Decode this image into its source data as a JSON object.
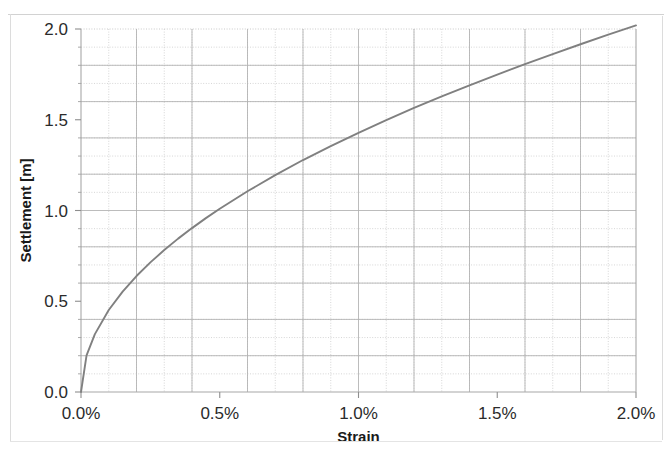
{
  "chart_data": {
    "type": "line",
    "title": "",
    "xlabel": "Strain",
    "ylabel": "Settlement [m]",
    "xlim": [
      0.0,
      2.0
    ],
    "ylim": [
      0.0,
      2.0
    ],
    "x_tick_labels": [
      "0.0%",
      "0.5%",
      "1.0%",
      "1.5%",
      "2.0%"
    ],
    "x_tick_values": [
      0.0,
      0.5,
      1.0,
      1.5,
      2.0
    ],
    "y_tick_labels": [
      "0.0",
      "0.5",
      "1.0",
      "1.5",
      "2.0"
    ],
    "y_tick_values": [
      0.0,
      0.5,
      1.0,
      1.5,
      2.0
    ],
    "grid": "major-solid-and-minor-dotted",
    "x_minor_step": 0.1,
    "y_minor_step": 0.1,
    "legend": "none",
    "series": [
      {
        "name": "Settlement vs Strain",
        "color": "#808080",
        "x": [
          0.0,
          0.02,
          0.05,
          0.1,
          0.15,
          0.2,
          0.25,
          0.3,
          0.35,
          0.4,
          0.45,
          0.5,
          0.6,
          0.7,
          0.8,
          0.9,
          1.0,
          1.1,
          1.2,
          1.3,
          1.4,
          1.5,
          1.6,
          1.7,
          1.8,
          1.9,
          2.0
        ],
        "y": [
          0.0,
          0.202,
          0.319,
          0.452,
          0.553,
          0.639,
          0.714,
          0.782,
          0.845,
          0.903,
          0.958,
          1.01,
          1.106,
          1.195,
          1.278,
          1.355,
          1.428,
          1.498,
          1.565,
          1.629,
          1.69,
          1.749,
          1.807,
          1.862,
          1.916,
          1.969,
          2.02
        ]
      }
    ]
  },
  "axes": {
    "y_axis_title": "Settlement [m]",
    "x_axis_title": "Strain"
  }
}
